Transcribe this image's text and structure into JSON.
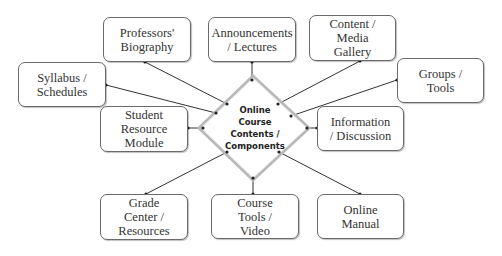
{
  "diagram": {
    "center": {
      "label": "Online\nCourse\nContents /\nComponents"
    },
    "nodes": [
      {
        "id": "professors-biography",
        "label": "Professors'\nBiography",
        "x": 103,
        "y": 17,
        "w": 88,
        "h": 45
      },
      {
        "id": "announcements-lectures",
        "label": "Announcements\n/ Lectures",
        "x": 208,
        "y": 17,
        "w": 88,
        "h": 45
      },
      {
        "id": "content-media-gallery",
        "label": "Content /\nMedia\nGallery",
        "x": 309,
        "y": 15,
        "w": 87,
        "h": 46
      },
      {
        "id": "syllabus-schedules",
        "label": "Syllabus /\nSchedules",
        "x": 18,
        "y": 62,
        "w": 88,
        "h": 45
      },
      {
        "id": "groups-tools",
        "label": "Groups /\nTools",
        "x": 397,
        "y": 58,
        "w": 87,
        "h": 45
      },
      {
        "id": "student-resource-module",
        "label": "Student\nResource\nModule",
        "x": 100,
        "y": 106,
        "w": 88,
        "h": 46
      },
      {
        "id": "information-discussion",
        "label": "Information\n/ Discussion",
        "x": 317,
        "y": 106,
        "w": 87,
        "h": 45
      },
      {
        "id": "grade-center-resources",
        "label": "Grade\nCenter /\nResources",
        "x": 100,
        "y": 194,
        "w": 88,
        "h": 46
      },
      {
        "id": "course-tools-video",
        "label": "Course\nTools /\nVideo",
        "x": 211,
        "y": 194,
        "w": 88,
        "h": 45
      },
      {
        "id": "online-manual",
        "label": "Online\nManual",
        "x": 317,
        "y": 194,
        "w": 87,
        "h": 45
      }
    ],
    "edges": [
      {
        "to": "professors-biography",
        "from_pt": [
          227,
          104
        ],
        "to_pt": [
          145,
          62
        ]
      },
      {
        "to": "announcements-lectures",
        "from_pt": [
          252,
          80
        ],
        "to_pt": [
          252,
          62
        ]
      },
      {
        "to": "content-media-gallery",
        "from_pt": [
          278,
          104
        ],
        "to_pt": [
          360,
          61
        ]
      },
      {
        "to": "syllabus-schedules",
        "from_pt": [
          216,
          113
        ],
        "to_pt": [
          106,
          85
        ]
      },
      {
        "to": "groups-tools",
        "from_pt": [
          291,
          116
        ],
        "to_pt": [
          397,
          80
        ]
      },
      {
        "to": "student-resource-module",
        "from_pt": [
          203,
          128
        ],
        "to_pt": [
          188,
          128
        ]
      },
      {
        "to": "information-discussion",
        "from_pt": [
          307,
          128
        ],
        "to_pt": [
          317,
          128
        ]
      },
      {
        "to": "grade-center-resources",
        "from_pt": [
          227,
          152
        ],
        "to_pt": [
          146,
          194
        ]
      },
      {
        "to": "course-tools-video",
        "from_pt": [
          253,
          178
        ],
        "to_pt": [
          253,
          194
        ]
      },
      {
        "to": "online-manual",
        "from_pt": [
          279,
          152
        ],
        "to_pt": [
          360,
          194
        ]
      }
    ],
    "colors": {
      "box_border": "#6a6a6a",
      "line": "#333333",
      "diamond_border": "#b0b0b0"
    }
  }
}
